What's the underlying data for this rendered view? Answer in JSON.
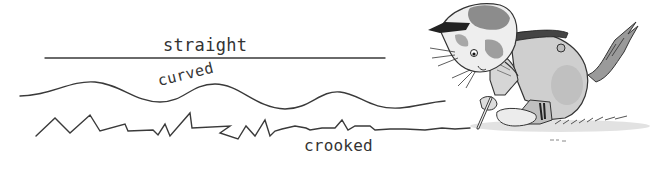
{
  "illustration": {
    "description": "Children's book illustration teaching line types: straight, curved, crooked, with a cat character drawing a line on the ground",
    "labels": {
      "straight": "straight",
      "curved": "curved",
      "crooked": "crooked"
    },
    "character": {
      "type": "cat",
      "action": "drawing a line on the ground with a stick"
    },
    "colors": {
      "background": "#ffffff",
      "ink": "#333333",
      "line": "#3a3a3a",
      "fur_dark": "#4a4a4a",
      "fur_mid": "#8c8c8c",
      "fur_light": "#d8d8d8",
      "shadow": "#c8c8c8"
    }
  }
}
